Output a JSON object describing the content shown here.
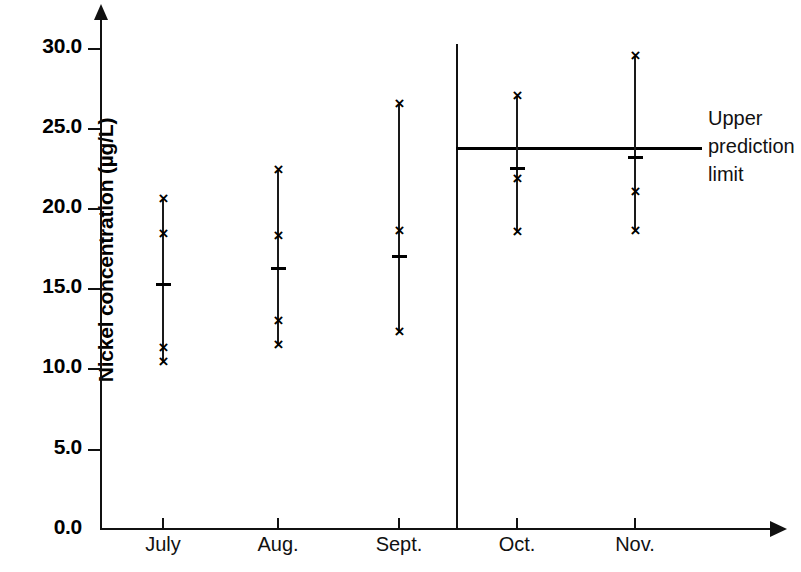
{
  "chart_data": {
    "type": "scatter",
    "title": "",
    "xlabel": "",
    "ylabel": "Nickel concentration (µg/L)",
    "ylim": [
      0.0,
      30.0
    ],
    "ytick_labels": [
      "30.0",
      "25.0",
      "20.0",
      "15.0",
      "10.0",
      "5.0",
      "0.0"
    ],
    "ytick_values": [
      30.0,
      25.0,
      20.0,
      15.0,
      10.0,
      5.0,
      0.0
    ],
    "grid": false,
    "legend": "none",
    "categories": [
      "July",
      "Aug.",
      "Sept.",
      "Oct.",
      "Nov."
    ],
    "series": [
      {
        "name": "July",
        "points": [
          20.6,
          18.4,
          11.3,
          10.4
        ],
        "mean": 15.3,
        "range_low": 10.4,
        "range_high": 20.6
      },
      {
        "name": "Aug.",
        "points": [
          22.4,
          18.3,
          13.0,
          11.5
        ],
        "mean": 16.3,
        "range_low": 11.5,
        "range_high": 22.4
      },
      {
        "name": "Sept.",
        "points": [
          26.5,
          18.6,
          12.3
        ],
        "mean": 17.0,
        "range_low": 12.3,
        "range_high": 26.5
      },
      {
        "name": "Oct.",
        "points": [
          27.0,
          21.8,
          18.5
        ],
        "mean": 22.5,
        "range_low": 18.5,
        "range_high": 27.0
      },
      {
        "name": "Nov.",
        "points": [
          29.5,
          21.0,
          18.6
        ],
        "mean": 23.2,
        "range_low": 18.6,
        "range_high": 29.5
      }
    ],
    "reference_line": {
      "label_lines": [
        "Upper",
        "prediction",
        "limit"
      ],
      "value": 23.9,
      "starts_at_category": "Oct."
    },
    "period_divider": {
      "between": [
        "Sept.",
        "Oct."
      ]
    },
    "colors": {
      "axis": "#111111",
      "marker": "#000000",
      "reference_line": "#000000"
    }
  },
  "upl_text": {
    "line1": "Upper",
    "line2": "prediction",
    "line3": "limit"
  },
  "y_labels": {
    "t0": "30.0",
    "t1": "25.0",
    "t2": "20.0",
    "t3": "15.0",
    "t4": "10.0",
    "t5": "5.0",
    "t6": "0.0"
  },
  "x_labels": {
    "c0": "July",
    "c1": "Aug.",
    "c2": "Sept.",
    "c3": "Oct.",
    "c4": "Nov."
  },
  "marker_glyph": "×"
}
